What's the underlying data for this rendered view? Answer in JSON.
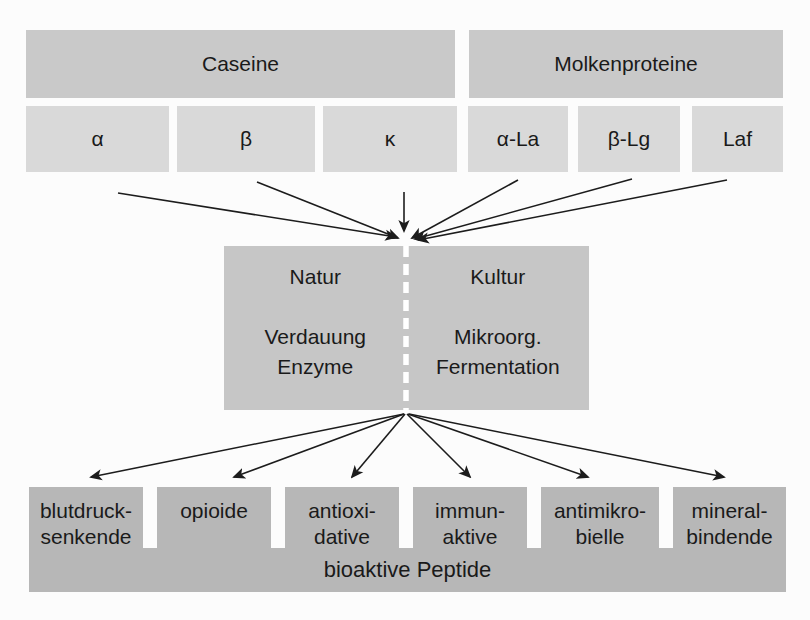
{
  "diagram": {
    "groups": [
      {
        "label": "Caseine",
        "subunits": [
          {
            "label": "α"
          },
          {
            "label": "β"
          },
          {
            "label": "κ"
          }
        ]
      },
      {
        "label": "Molkenproteine",
        "subunits": [
          {
            "label": "α-La"
          },
          {
            "label": "β-Lg"
          },
          {
            "label": "Laf"
          }
        ]
      }
    ],
    "process": {
      "left": {
        "title": "Natur",
        "line1": "Verdauung",
        "line2": "Enzyme"
      },
      "right": {
        "title": "Kultur",
        "line1": "Mikroorg.",
        "line2": "Fermentation"
      }
    },
    "outputs": [
      {
        "line1": "blutdruck-",
        "line2": "senkende"
      },
      {
        "line1": "opioide",
        "line2": ""
      },
      {
        "line1": "antioxi-",
        "line2": "dative"
      },
      {
        "line1": "immun-",
        "line2": "aktive"
      },
      {
        "line1": "antimikro-",
        "line2": "bielle"
      },
      {
        "line1": "mineral-",
        "line2": "bindende"
      }
    ],
    "footer": "bioaktive Peptide",
    "colors": {
      "header_box": "#c9c9c9",
      "subunit_box": "#d9d9d9",
      "process_box": "#c6c6c6",
      "output_box": "#b7b7b7",
      "arrow": "#1c1c1c",
      "divider_dash": "#ffffff",
      "background": "#fcfcfc",
      "text": "#1a1a1a"
    }
  }
}
